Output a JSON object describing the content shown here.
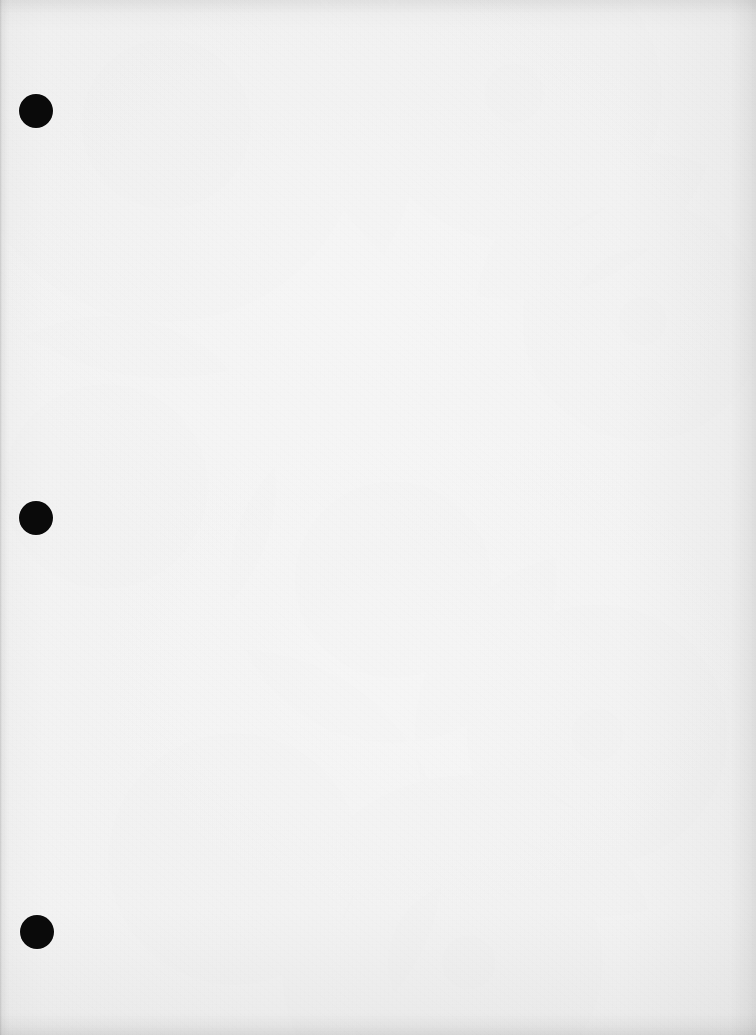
{
  "document": {
    "kind": "scanned-page",
    "page_label": "",
    "body_text": "",
    "width_px": 756,
    "height_px": 1035,
    "paper_color": "#fafafa",
    "ink_color": "#0a0a0a",
    "edge_shadow_color": "#787878"
  },
  "punch_holes": [
    {
      "name": "punch-hole-top",
      "cx": 36,
      "cy": 111,
      "r": 17
    },
    {
      "name": "punch-hole-middle",
      "cx": 36,
      "cy": 518,
      "r": 17
    },
    {
      "name": "punch-hole-bottom",
      "cx": 37,
      "cy": 932,
      "r": 17
    }
  ]
}
